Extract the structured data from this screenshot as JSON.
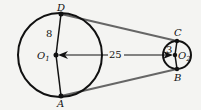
{
  "diagram": {
    "type": "two circles with external tangent lines (belt)",
    "circle_large": {
      "center_label": "O",
      "center_sub": "1",
      "radius_label": "8",
      "points": {
        "top": "D",
        "bottom": "A"
      }
    },
    "circle_small": {
      "center_label": "O",
      "center_sub": "2",
      "radius_label": "3",
      "points": {
        "top": "C",
        "bottom": "B"
      }
    },
    "center_distance_label": "25",
    "colors": {
      "stroke": "#111111",
      "tangent": "#666666",
      "background": "#f4f4f2"
    }
  }
}
